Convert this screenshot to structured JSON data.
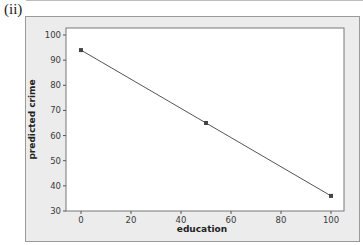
{
  "panel_label": "(ii)",
  "colors": {
    "frame_bg": "#ececec",
    "plot_bg": "#ffffff",
    "line": "#555555",
    "marker": "#444444",
    "axis": "#555555"
  },
  "chart_data": {
    "type": "line",
    "title": "",
    "xlabel": "education",
    "ylabel": "predicted crime",
    "x": [
      0,
      50,
      100
    ],
    "series": [
      {
        "name": "predicted crime",
        "values": [
          94,
          65,
          36
        ],
        "markers": true
      }
    ],
    "xlim": [
      -5,
      105
    ],
    "ylim": [
      30,
      100
    ],
    "xticks": [
      0,
      20,
      40,
      60,
      80,
      100
    ],
    "yticks": [
      30,
      40,
      50,
      60,
      70,
      80,
      90,
      100
    ],
    "grid": false,
    "legend": null
  }
}
